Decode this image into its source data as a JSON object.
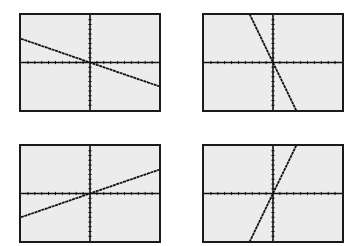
{
  "colors": {
    "background": "#ffffff",
    "screen": "#ececec",
    "frame": "#1a1a1a",
    "axis": "#111111",
    "line": "#111111"
  },
  "window": {
    "xmin": -10,
    "xmax": 10,
    "ymin": -10,
    "ymax": 10,
    "xscl": 1,
    "yscl": 1
  },
  "chart_data": [
    {
      "type": "line",
      "position": "top-left",
      "title": "",
      "xlabel": "",
      "ylabel": "",
      "xlim": [
        -10,
        10
      ],
      "ylim": [
        -10,
        10
      ],
      "grid": false,
      "tick_marks": true,
      "series": [
        {
          "name": "y = -0.5x",
          "slope": -0.5,
          "intercept": 0,
          "x": [
            -10,
            10
          ],
          "y": [
            5,
            -5
          ]
        }
      ]
    },
    {
      "type": "line",
      "position": "top-right",
      "title": "",
      "xlabel": "",
      "ylabel": "",
      "xlim": [
        -10,
        10
      ],
      "ylim": [
        -10,
        10
      ],
      "grid": false,
      "tick_marks": true,
      "series": [
        {
          "name": "y = -3x",
          "slope": -3,
          "intercept": 0,
          "x": [
            -3.33,
            3.33
          ],
          "y": [
            10,
            -10
          ]
        }
      ]
    },
    {
      "type": "line",
      "position": "bottom-left",
      "title": "",
      "xlabel": "",
      "ylabel": "",
      "xlim": [
        -10,
        10
      ],
      "ylim": [
        -10,
        10
      ],
      "grid": false,
      "tick_marks": true,
      "series": [
        {
          "name": "y = 0.5x",
          "slope": 0.5,
          "intercept": 0,
          "x": [
            -10,
            10
          ],
          "y": [
            -5,
            5
          ]
        }
      ]
    },
    {
      "type": "line",
      "position": "bottom-right",
      "title": "",
      "xlabel": "",
      "ylabel": "",
      "xlim": [
        -10,
        10
      ],
      "ylim": [
        -10,
        10
      ],
      "grid": false,
      "tick_marks": true,
      "series": [
        {
          "name": "y = 3x",
          "slope": 3,
          "intercept": 0,
          "x": [
            -3.33,
            3.33
          ],
          "y": [
            -10,
            10
          ]
        }
      ]
    }
  ],
  "layout": {
    "panels": [
      {
        "left": 19,
        "top": 13,
        "width": 142,
        "height": 99
      },
      {
        "left": 202,
        "top": 13,
        "width": 142,
        "height": 99
      },
      {
        "left": 19,
        "top": 144,
        "width": 142,
        "height": 99
      },
      {
        "left": 202,
        "top": 144,
        "width": 142,
        "height": 99
      }
    ]
  }
}
